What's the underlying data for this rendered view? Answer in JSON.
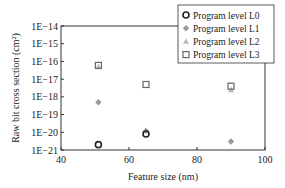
{
  "chart_data": {
    "type": "scatter",
    "title": "",
    "xlabel": "Feature size (nm)",
    "ylabel": "Raw bit cross section (cm²)",
    "yscale": "log",
    "xlim": [
      40,
      100
    ],
    "ylim": [
      1e-21,
      1e-14
    ],
    "xticks": [
      "40",
      "60",
      "80",
      "100"
    ],
    "yticks": [
      "1E-14",
      "1E-15",
      "1E-16",
      "1E-17",
      "1E-18",
      "1E-19",
      "1E-20",
      "1E-21"
    ],
    "grid": false,
    "legend_position": "upper right",
    "series": [
      {
        "name": "Program level L0",
        "marker": "open-circle",
        "color": "#222222",
        "points": [
          {
            "x": 51,
            "y": 2e-21
          },
          {
            "x": 65,
            "y": 8e-21
          }
        ]
      },
      {
        "name": "Program level L1",
        "marker": "filled-diamond",
        "color": "#999999",
        "points": [
          {
            "x": 51,
            "y": 5e-19
          },
          {
            "x": 65,
            "y": 1.2e-20
          },
          {
            "x": 90,
            "y": 3e-21
          }
        ]
      },
      {
        "name": "Program level L2",
        "marker": "filled-triangle",
        "color": "#bbbbbb",
        "points": [
          {
            "x": 51,
            "y": 5e-17
          },
          {
            "x": 65,
            "y": 1.2e-20
          },
          {
            "x": 90,
            "y": 2.5e-18
          }
        ]
      },
      {
        "name": "Program level L3",
        "marker": "open-square",
        "color": "#666666",
        "points": [
          {
            "x": 51,
            "y": 6e-17
          },
          {
            "x": 65,
            "y": 5e-18
          },
          {
            "x": 90,
            "y": 4e-18
          }
        ]
      }
    ]
  }
}
